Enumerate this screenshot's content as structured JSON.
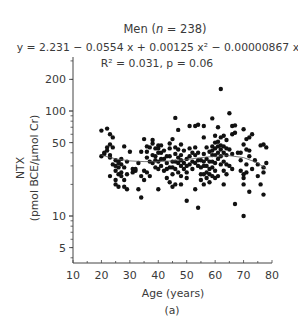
{
  "chart_data": {
    "type": "scatter",
    "title": "Men (n = 238)",
    "title_parts": {
      "prefix": "Men (",
      "italic": "n",
      "suffix": " = 238)"
    },
    "equation": "y = 2.231 − 0.0554 x + 0.00125 x² − 0.00000867 x³",
    "stats": "R² = 0.031, p = 0.06",
    "xlabel": "Age (years)",
    "ylabel": "NTX",
    "ylabel2": "(pmol BCE/µmol Cr)",
    "panel_label": "(a)",
    "xlim": [
      10,
      80
    ],
    "ylim": [
      3.5,
      330
    ],
    "yscale": "log",
    "x_ticks": [
      10,
      20,
      30,
      40,
      50,
      60,
      70,
      80
    ],
    "y_ticks": [
      5,
      10,
      50,
      100,
      200
    ],
    "grid": false,
    "fit_curve": {
      "type": "cubic polynomial (log10 y)",
      "x": [
        20,
        25,
        30,
        35,
        40,
        45,
        50,
        55,
        60,
        65,
        70,
        75,
        78
      ],
      "y": [
        38,
        35,
        33.5,
        33,
        33,
        33.5,
        34.5,
        36,
        37,
        37.5,
        36,
        32,
        28
      ]
    },
    "points": [
      [
        20,
        65
      ],
      [
        20,
        37
      ],
      [
        21,
        39
      ],
      [
        21,
        40
      ],
      [
        22,
        68
      ],
      [
        22,
        45
      ],
      [
        22,
        42
      ],
      [
        23,
        60
      ],
      [
        23,
        48
      ],
      [
        23,
        38
      ],
      [
        23,
        36
      ],
      [
        23,
        24
      ],
      [
        24,
        56
      ],
      [
        24,
        45
      ],
      [
        24,
        31
      ],
      [
        25,
        34
      ],
      [
        25,
        30
      ],
      [
        25,
        27
      ],
      [
        25,
        22
      ],
      [
        25,
        20
      ],
      [
        26,
        33
      ],
      [
        26,
        32
      ],
      [
        26,
        29
      ],
      [
        26,
        25
      ],
      [
        26,
        19
      ],
      [
        27,
        35
      ],
      [
        27,
        31
      ],
      [
        27,
        26
      ],
      [
        27,
        24
      ],
      [
        28,
        46
      ],
      [
        28,
        29
      ],
      [
        28,
        22
      ],
      [
        28,
        19
      ],
      [
        29,
        33
      ],
      [
        29,
        25
      ],
      [
        29,
        18
      ],
      [
        30,
        41
      ],
      [
        31,
        28
      ],
      [
        31,
        26
      ],
      [
        32,
        28
      ],
      [
        32,
        27
      ],
      [
        33,
        18
      ],
      [
        33,
        32
      ],
      [
        34,
        41
      ],
      [
        34,
        24
      ],
      [
        34,
        15
      ],
      [
        35,
        27
      ],
      [
        35,
        22
      ],
      [
        35,
        54
      ],
      [
        36,
        46
      ],
      [
        36,
        41
      ],
      [
        36,
        36
      ],
      [
        36,
        26
      ],
      [
        37,
        45
      ],
      [
        37,
        33
      ],
      [
        37,
        24
      ],
      [
        38,
        53
      ],
      [
        38,
        49
      ],
      [
        38,
        38
      ],
      [
        38,
        32
      ],
      [
        39,
        44
      ],
      [
        39,
        37
      ],
      [
        39,
        34
      ],
      [
        39,
        29
      ],
      [
        40,
        47
      ],
      [
        40,
        44
      ],
      [
        40,
        40
      ],
      [
        40,
        33
      ],
      [
        40,
        28
      ],
      [
        40,
        18
      ],
      [
        41,
        47
      ],
      [
        41,
        40
      ],
      [
        41,
        35
      ],
      [
        41,
        30
      ],
      [
        42,
        42
      ],
      [
        42,
        35
      ],
      [
        42,
        27
      ],
      [
        43,
        37
      ],
      [
        43,
        32
      ],
      [
        43,
        28
      ],
      [
        43,
        23
      ],
      [
        44,
        49
      ],
      [
        44,
        44
      ],
      [
        44,
        37
      ],
      [
        44,
        29
      ],
      [
        44,
        21
      ],
      [
        45,
        54
      ],
      [
        45,
        33
      ],
      [
        45,
        29
      ],
      [
        45,
        25
      ],
      [
        45,
        19
      ],
      [
        46,
        86
      ],
      [
        46,
        45
      ],
      [
        46,
        39
      ],
      [
        46,
        33
      ],
      [
        46,
        28
      ],
      [
        46,
        20
      ],
      [
        47,
        66
      ],
      [
        47,
        43
      ],
      [
        47,
        36
      ],
      [
        47,
        32
      ],
      [
        47,
        26
      ],
      [
        48,
        48
      ],
      [
        48,
        38
      ],
      [
        48,
        34
      ],
      [
        48,
        30
      ],
      [
        48,
        24
      ],
      [
        48,
        20
      ],
      [
        49,
        42
      ],
      [
        49,
        32
      ],
      [
        49,
        28
      ],
      [
        50,
        35
      ],
      [
        50,
        30
      ],
      [
        50,
        26
      ],
      [
        50,
        23
      ],
      [
        50,
        14
      ],
      [
        51,
        72
      ],
      [
        51,
        44
      ],
      [
        51,
        37
      ],
      [
        51,
        31
      ],
      [
        52,
        40
      ],
      [
        52,
        33
      ],
      [
        52,
        28
      ],
      [
        53,
        72
      ],
      [
        53,
        45
      ],
      [
        53,
        38
      ],
      [
        53,
        32
      ],
      [
        53,
        18
      ],
      [
        54,
        74
      ],
      [
        54,
        40
      ],
      [
        54,
        34
      ],
      [
        54,
        30
      ],
      [
        54,
        12
      ],
      [
        55,
        34
      ],
      [
        55,
        29
      ],
      [
        55,
        25
      ],
      [
        55,
        22
      ],
      [
        56,
        72
      ],
      [
        56,
        56
      ],
      [
        56,
        39
      ],
      [
        56,
        33
      ],
      [
        56,
        30
      ],
      [
        56,
        25
      ],
      [
        56,
        20
      ],
      [
        57,
        45
      ],
      [
        57,
        35
      ],
      [
        57,
        30
      ],
      [
        57,
        26
      ],
      [
        57,
        23
      ],
      [
        58,
        41
      ],
      [
        58,
        33
      ],
      [
        58,
        28
      ],
      [
        58,
        25
      ],
      [
        58,
        21
      ],
      [
        59,
        85
      ],
      [
        59,
        46
      ],
      [
        59,
        42
      ],
      [
        59,
        38
      ],
      [
        59,
        33
      ],
      [
        59,
        29
      ],
      [
        59,
        24
      ],
      [
        60,
        58
      ],
      [
        60,
        50
      ],
      [
        60,
        44
      ],
      [
        60,
        38
      ],
      [
        60,
        32
      ],
      [
        60,
        27
      ],
      [
        60,
        23
      ],
      [
        61,
        70
      ],
      [
        61,
        51
      ],
      [
        61,
        46
      ],
      [
        61,
        40
      ],
      [
        61,
        35
      ],
      [
        61,
        24
      ],
      [
        62,
        162
      ],
      [
        62,
        56
      ],
      [
        62,
        47
      ],
      [
        62,
        43
      ],
      [
        62,
        37
      ],
      [
        62,
        31
      ],
      [
        63,
        58
      ],
      [
        63,
        46
      ],
      [
        63,
        40
      ],
      [
        63,
        33
      ],
      [
        63,
        27
      ],
      [
        63,
        20
      ],
      [
        64,
        53
      ],
      [
        64,
        44
      ],
      [
        64,
        38
      ],
      [
        64,
        31
      ],
      [
        64,
        25
      ],
      [
        65,
        95
      ],
      [
        65,
        43
      ],
      [
        65,
        30
      ],
      [
        66,
        72
      ],
      [
        66,
        60
      ],
      [
        66,
        39
      ],
      [
        66,
        28
      ],
      [
        67,
        73
      ],
      [
        67,
        62
      ],
      [
        67,
        13
      ],
      [
        68,
        40
      ],
      [
        69,
        40
      ],
      [
        69,
        34
      ],
      [
        69,
        27
      ],
      [
        70,
        67
      ],
      [
        70,
        48
      ],
      [
        70,
        25
      ],
      [
        70,
        23
      ],
      [
        70,
        20
      ],
      [
        70,
        10
      ],
      [
        71,
        54
      ],
      [
        71,
        43
      ],
      [
        71,
        31
      ],
      [
        71,
        26
      ],
      [
        72,
        56
      ],
      [
        72,
        42
      ],
      [
        72,
        37
      ],
      [
        72,
        17
      ],
      [
        73,
        60
      ],
      [
        73,
        28
      ],
      [
        74,
        34
      ],
      [
        75,
        31
      ],
      [
        75,
        24
      ],
      [
        76,
        47
      ],
      [
        76,
        20
      ],
      [
        77,
        48
      ],
      [
        77,
        29
      ],
      [
        77,
        26
      ],
      [
        77,
        16
      ],
      [
        78,
        32
      ],
      [
        78,
        45
      ]
    ]
  }
}
